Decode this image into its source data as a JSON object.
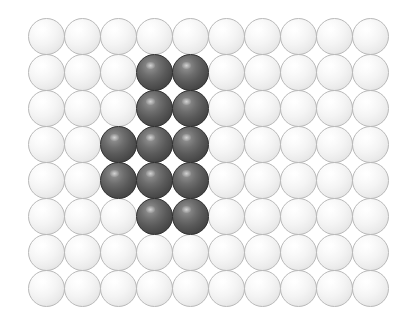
{
  "figure": {
    "name": "sphere-lattice",
    "background_color": "#ffffff",
    "rows": 8,
    "columns": 10,
    "grid": {
      "left": 28,
      "top": 18,
      "cell_width": 36,
      "cell_height": 36,
      "sphere_diameter": 37
    },
    "colors": {
      "light_sphere": "#f2f2f2",
      "light_sphere_edge": "#b9b9b9",
      "light_sphere_highlight": "#ffffff",
      "dark_sphere": "#5a5a5a",
      "dark_sphere_edge": "#2f2f2f",
      "dark_sphere_highlight": "#9a9a9a"
    },
    "legend_labels": {
      "light": "matrix-sphere",
      "dark": "substituted-sphere"
    },
    "counts": {
      "total": 80,
      "dark": 12,
      "light": 68
    }
  },
  "chart_data": {
    "type": "heatmap",
    "title": "",
    "xlabel": "",
    "ylabel": "",
    "categories_x": [
      "1",
      "2",
      "3",
      "4",
      "5",
      "6",
      "7",
      "8",
      "9",
      "10"
    ],
    "categories_y": [
      "1",
      "2",
      "3",
      "4",
      "5",
      "6",
      "7",
      "8"
    ],
    "value_labels": {
      "0": "light",
      "1": "dark"
    },
    "values": [
      [
        0,
        0,
        0,
        0,
        0,
        0,
        0,
        0,
        0,
        0
      ],
      [
        0,
        0,
        0,
        1,
        1,
        0,
        0,
        0,
        0,
        0
      ],
      [
        0,
        0,
        0,
        1,
        1,
        0,
        0,
        0,
        0,
        0
      ],
      [
        0,
        0,
        1,
        1,
        1,
        0,
        0,
        0,
        0,
        0
      ],
      [
        0,
        0,
        1,
        1,
        1,
        0,
        0,
        0,
        0,
        0
      ],
      [
        0,
        0,
        0,
        1,
        1,
        0,
        0,
        0,
        0,
        0
      ],
      [
        0,
        0,
        0,
        0,
        0,
        0,
        0,
        0,
        0,
        0
      ],
      [
        0,
        0,
        0,
        0,
        0,
        0,
        0,
        0,
        0,
        0
      ]
    ],
    "dark_cells": [
      [
        1,
        3
      ],
      [
        1,
        4
      ],
      [
        2,
        3
      ],
      [
        2,
        4
      ],
      [
        3,
        2
      ],
      [
        3,
        3
      ],
      [
        3,
        4
      ],
      [
        4,
        2
      ],
      [
        4,
        3
      ],
      [
        4,
        4
      ],
      [
        5,
        3
      ],
      [
        5,
        4
      ]
    ],
    "legend": [
      "light sphere",
      "dark sphere"
    ],
    "grid": false,
    "legend_position": "none"
  }
}
